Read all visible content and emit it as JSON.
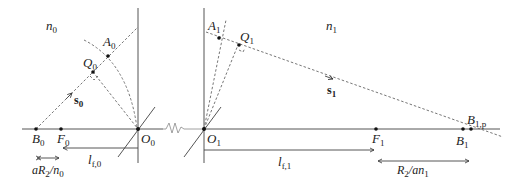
{
  "diagram": {
    "left_medium": {
      "index_label": "n",
      "index_sub": "0",
      "points": {
        "A": {
          "label": "A",
          "sub": "0"
        },
        "Q": {
          "label": "Q",
          "sub": "0"
        },
        "B": {
          "label": "B",
          "sub": "0"
        },
        "F": {
          "label": "F",
          "sub": "0"
        },
        "O": {
          "label": "O",
          "sub": "0"
        }
      },
      "vector": {
        "label": "s",
        "sub": "0"
      },
      "focal_length": {
        "label": "l",
        "sub": "f,0"
      },
      "offset": {
        "label": "aR",
        "sub2": "2",
        "mid": "/n",
        "sub3": "0"
      }
    },
    "right_medium": {
      "index_label": "n",
      "index_sub": "1",
      "points": {
        "A": {
          "label": "A",
          "sub": "1"
        },
        "Q": {
          "label": "Q",
          "sub": "1"
        },
        "B": {
          "label": "B",
          "sub": "1"
        },
        "Bp": {
          "label": "B",
          "sub": "1,p"
        },
        "F": {
          "label": "F",
          "sub": "1"
        },
        "O": {
          "label": "O",
          "sub": "1"
        }
      },
      "vector": {
        "label": "s",
        "sub": "1"
      },
      "focal_length": {
        "label": "l",
        "sub": "f,1"
      },
      "offset": {
        "label": "R",
        "sub2": "2",
        "mid": "/an",
        "sub3": "1"
      }
    },
    "break_symbol": "zigzag"
  }
}
